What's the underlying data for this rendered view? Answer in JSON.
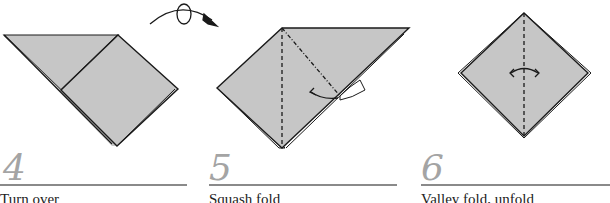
{
  "diagram": {
    "type": "origami-instructions",
    "colors": {
      "paper": "#c6c6c6",
      "line": "#1a1a1a",
      "step_number": "#a4a4a4",
      "rule": "#8a8a8a"
    },
    "steps": [
      {
        "number": "4",
        "caption": "Turn over",
        "symbols": [
          "turn-over-arrow"
        ]
      },
      {
        "number": "5",
        "caption": "Squash fold",
        "symbols": [
          "valley-fold-line",
          "mountain-fold-line",
          "squash-arrow"
        ]
      },
      {
        "number": "6",
        "caption": "Valley fold, unfold",
        "symbols": [
          "valley-fold-line",
          "fold-unfold-arrow"
        ]
      }
    ]
  }
}
